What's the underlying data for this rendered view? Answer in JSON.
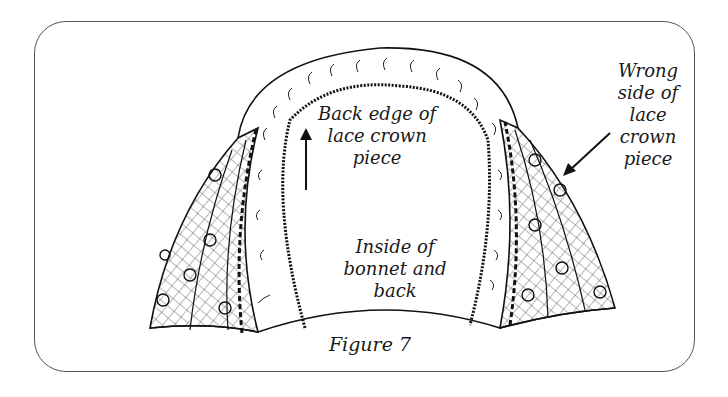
{
  "figure": {
    "caption": "Figure 7",
    "labels": {
      "back_edge": [
        "Back edge of",
        "lace crown",
        "piece"
      ],
      "wrong_side": [
        "Wrong",
        "side of",
        "lace",
        "crown",
        "piece"
      ],
      "inside": [
        "Inside of",
        "bonnet and",
        "back"
      ]
    },
    "colors": {
      "ink": "#1a1a1a",
      "frame": "#555555",
      "background": "#ffffff"
    }
  }
}
